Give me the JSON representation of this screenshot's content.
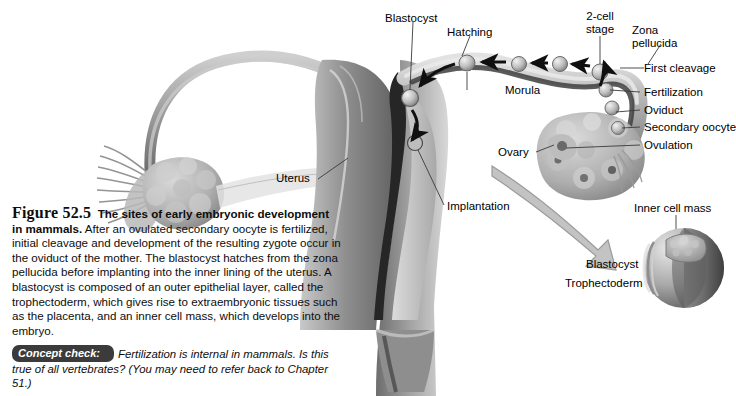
{
  "figure": {
    "number": "Figure 52.5",
    "title": "The sites of early embryonic development in mammals.",
    "body": " After an ovulated secondary oocyte is fertilized, initial cleavage and development of the resulting zygote occur in the oviduct of the mother. The blastocyst hatches from the zona pellucida before implanting into the inner lining of the uterus. A blastocyst is composed of an outer epithelial layer, called the trophectoderm, which gives rise to extraembryonic tissues such as the placenta, and an inner cell mass, which develops into the embryo.",
    "concept_check_tag": "Concept check:",
    "concept_check_text": "Fertilization is internal in mammals. Is this true of all vertebrates? (You may need to refer back to Chapter 51.)"
  },
  "labels": {
    "blastocyst": "Blastocyst",
    "hatching": "Hatching",
    "two_cell_stage": "2-cell\nstage",
    "zona_pellucida": "Zona\npellucida",
    "first_cleavage": "First cleavage",
    "fertilization": "Fertilization",
    "oviduct": "Oviduct",
    "secondary_oocyte": "Secondary oocyte",
    "ovulation": "Ovulation",
    "morula": "Morula",
    "ovary": "Ovary",
    "uterus": "Uterus",
    "implantation": "Implantation",
    "inner_cell_mass": "Inner cell mass",
    "inset_blastocyst": "Blastocyst",
    "trophectoderm": "Trophectoderm"
  },
  "colors": {
    "background": "#ffffff",
    "tissue_light": "#d2d2d2",
    "tissue_mid": "#9a9a9a",
    "tissue_dark": "#5a5a5a",
    "cavity": "#2a2a2a",
    "leader_line": "#3a3a3a",
    "arrow_black": "#101010",
    "big_arrow": "#b9b9b9",
    "concept_tag": "#3b3b3b"
  }
}
